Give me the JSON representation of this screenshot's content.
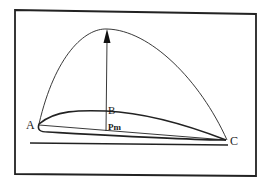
{
  "diagram": {
    "labels": {
      "leading_edge": "A",
      "point_b": "B",
      "mean_pressure": "Pm",
      "trailing_edge": "C"
    },
    "colors": {
      "line": "#1a1a1a",
      "background": "#ffffff"
    }
  }
}
